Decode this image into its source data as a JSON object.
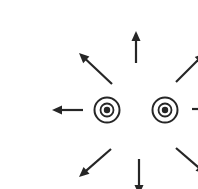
{
  "canvas": {
    "width": 198,
    "height": 189,
    "background": "#ffffff"
  },
  "diagram": {
    "stroke_color": "#262626",
    "shaft_width": 2.2,
    "arrowhead": {
      "length": 10,
      "width": 9
    },
    "symbols": [
      {
        "name": "circled-dot-left",
        "cx": 67,
        "cy": 94,
        "outer_r": 12.5,
        "inner_r": 6.5,
        "dot_r": 3.2,
        "outer_stroke": 2,
        "inner_stroke": 1.8
      },
      {
        "name": "circled-dot-right",
        "cx": 125,
        "cy": 94,
        "outer_r": 12.5,
        "inner_r": 6.5,
        "dot_r": 3.2,
        "outer_stroke": 2,
        "inner_stroke": 1.8
      }
    ],
    "arrows": [
      {
        "name": "arrow-up",
        "x1": 96,
        "y1": 47,
        "x2": 96,
        "y2": 15
      },
      {
        "name": "arrow-upper-left",
        "x1": 72,
        "y1": 68,
        "x2": 39,
        "y2": 37
      },
      {
        "name": "arrow-upper-right",
        "x1": 136,
        "y1": 66,
        "x2": 165,
        "y2": 37
      },
      {
        "name": "arrow-left",
        "x1": 43,
        "y1": 94,
        "x2": 12,
        "y2": 94
      },
      {
        "name": "arrow-right",
        "x1": 152,
        "y1": 93,
        "x2": 187,
        "y2": 93
      },
      {
        "name": "arrow-lower-left",
        "x1": 71,
        "y1": 133,
        "x2": 39,
        "y2": 161
      },
      {
        "name": "arrow-down",
        "x1": 99,
        "y1": 143,
        "x2": 99,
        "y2": 179
      },
      {
        "name": "arrow-lower-right",
        "x1": 136,
        "y1": 132,
        "x2": 166,
        "y2": 158
      }
    ]
  }
}
